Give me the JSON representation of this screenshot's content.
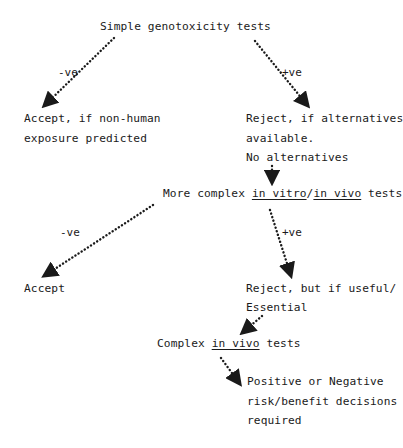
{
  "diagram": {
    "type": "flowchart",
    "nodes": {
      "start": {
        "label": "Simple genotoxicity tests"
      },
      "accept_nonhuman": {
        "lines": [
          "Accept, if non-human",
          "exposure predicted"
        ]
      },
      "reject_alternatives": {
        "lines": [
          "Reject, if alternatives",
          "available.",
          "No alternatives"
        ]
      },
      "more_complex": {
        "prefix": "More complex ",
        "u1": "in vitro",
        "sep": "/",
        "u2": "in vivo",
        "suffix": " tests"
      },
      "accept": {
        "label": "Accept"
      },
      "reject_useful": {
        "lines": [
          "Reject, but if useful/",
          "Essential"
        ]
      },
      "complex_in_vivo": {
        "prefix": "Complex ",
        "u1": "in vivo",
        "suffix": " tests"
      },
      "decisions": {
        "lines": [
          "Positive or Negative",
          "risk/benefit decisions",
          "required"
        ]
      }
    },
    "edges": [
      {
        "from": "start",
        "to": "accept_nonhuman",
        "label": "-ve"
      },
      {
        "from": "start",
        "to": "reject_alternatives",
        "label": "+ve"
      },
      {
        "from": "reject_alternatives",
        "to": "more_complex",
        "label": ""
      },
      {
        "from": "more_complex",
        "to": "accept",
        "label": "-ve"
      },
      {
        "from": "more_complex",
        "to": "reject_useful",
        "label": "+ve"
      },
      {
        "from": "reject_useful",
        "to": "complex_in_vivo",
        "label": ""
      },
      {
        "from": "complex_in_vivo",
        "to": "decisions",
        "label": ""
      }
    ],
    "colors": {
      "ink": "#1a1a1a",
      "background": "#ffffff"
    }
  }
}
